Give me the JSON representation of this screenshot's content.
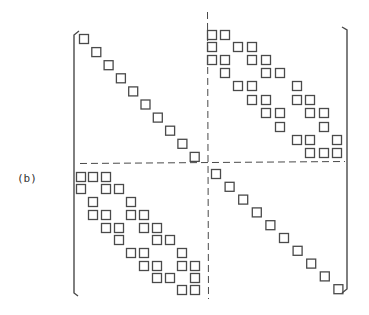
{
  "figure": {
    "label": "(b)",
    "colors": {
      "ink": "#4a4a4a",
      "background": "#ffffff"
    }
  },
  "matrix": {
    "block_size": 10,
    "square_size": 10,
    "partition": {
      "x": 207.5,
      "y": 163.5
    },
    "brackets": {
      "left": {
        "x": 74,
        "top": 35,
        "bottom": 293
      },
      "right": {
        "x": 347,
        "top": 30,
        "bottom": 289
      }
    },
    "blocks": {
      "top_left": {
        "type": "diagonal",
        "start": [
          79,
          34
        ],
        "step": [
          12.3,
          13.1
        ]
      },
      "bottom_right": {
        "type": "diagonal",
        "start": [
          211,
          169
        ],
        "step": [
          13.6,
          12.8
        ]
      },
      "top_right": {
        "type": "pattern",
        "col_x": [
          207,
          220,
          233,
          247,
          261,
          275,
          292,
          305,
          319,
          332
        ],
        "row_y": [
          30,
          42,
          55,
          68,
          81,
          95,
          108,
          122,
          135,
          148
        ],
        "rows": [
          [
            0,
            1
          ],
          [
            0,
            2,
            3
          ],
          [
            0,
            1,
            3,
            4
          ],
          [
            1,
            4,
            5
          ],
          [
            2,
            3,
            6
          ],
          [
            3,
            4,
            6,
            7
          ],
          [
            4,
            5,
            7,
            8
          ],
          [
            5,
            8
          ],
          [
            6,
            7,
            9
          ],
          [
            7,
            8,
            9
          ]
        ]
      },
      "bottom_left": {
        "type": "pattern",
        "col_x": [
          76,
          88,
          101,
          114,
          126,
          139,
          152,
          165,
          177,
          190
        ],
        "row_y": [
          172,
          184,
          197,
          210,
          223,
          235,
          248,
          261,
          273,
          285
        ],
        "rows": [
          [
            0,
            1,
            2
          ],
          [
            0,
            2,
            3
          ],
          [
            1,
            4
          ],
          [
            1,
            2,
            4,
            5
          ],
          [
            2,
            3,
            5,
            6
          ],
          [
            3,
            6,
            7
          ],
          [
            4,
            5,
            8
          ],
          [
            5,
            6,
            8,
            9
          ],
          [
            6,
            7,
            9
          ],
          [
            8,
            9
          ]
        ]
      }
    }
  }
}
